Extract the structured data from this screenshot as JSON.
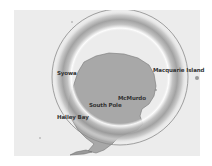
{
  "map": {
    "title": "Antarctica",
    "background_color": "#ececec",
    "land_color": "#a8a8a8",
    "ring_color": "#8a8a8a",
    "labels": [
      {
        "id": "syowa",
        "text": "Syowa",
        "x": 57,
        "y": 73
      },
      {
        "id": "macquarie",
        "text": "Macquarie Island",
        "x": 153,
        "y": 69
      },
      {
        "id": "mcmurdo",
        "text": "McMurdo",
        "x": 118,
        "y": 97
      },
      {
        "id": "south-pole",
        "text": "South Pole",
        "x": 89,
        "y": 104
      },
      {
        "id": "halley-bay",
        "text": "Halley Bay",
        "x": 57,
        "y": 116
      }
    ]
  }
}
